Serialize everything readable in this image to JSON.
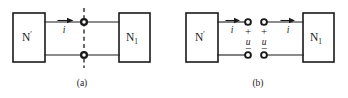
{
  "figure": {
    "type": "circuit-diagram",
    "background_color": "#ffffff",
    "line_color": "#1a1a1a"
  },
  "panels": [
    {
      "id": "panel-a",
      "caption": "(a)",
      "left_block": {
        "base": "N",
        "sup": "′"
      },
      "right_block": {
        "base": "N",
        "sub": "1"
      },
      "current_labels": [
        "i"
      ],
      "has_cut_line": true,
      "node_style": "filled",
      "node_count": 2
    },
    {
      "id": "panel-b",
      "caption": "(b)",
      "left_block": {
        "base": "N",
        "sup": "′"
      },
      "right_block": {
        "base": "N",
        "sub": "1"
      },
      "current_labels": [
        "i",
        "i"
      ],
      "voltage_labels": [
        "u",
        "u"
      ],
      "polarity_plus": "+",
      "polarity_minus": "−",
      "has_cut_line": false,
      "node_style": "open",
      "node_count": 4
    }
  ],
  "captions": {
    "a": "(a)",
    "b": "(b)"
  },
  "symbols": {
    "current": "i",
    "voltage": "u",
    "plus": "+",
    "minus": "−",
    "prime": "′",
    "network_letter": "N",
    "subscript_one": "1"
  }
}
